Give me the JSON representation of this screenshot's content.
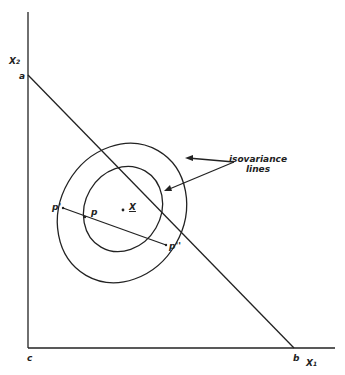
{
  "axes": {
    "x_label": "X",
    "x_sub": "1",
    "y_label": "X",
    "y_sub": "2"
  },
  "points": {
    "a": "a",
    "b": "b",
    "c": "c",
    "p": "p",
    "p_prime": "p'",
    "p_double_prime": "p''",
    "mean": "X"
  },
  "annotation": {
    "line1": "isovariance",
    "line2": "lines"
  }
}
